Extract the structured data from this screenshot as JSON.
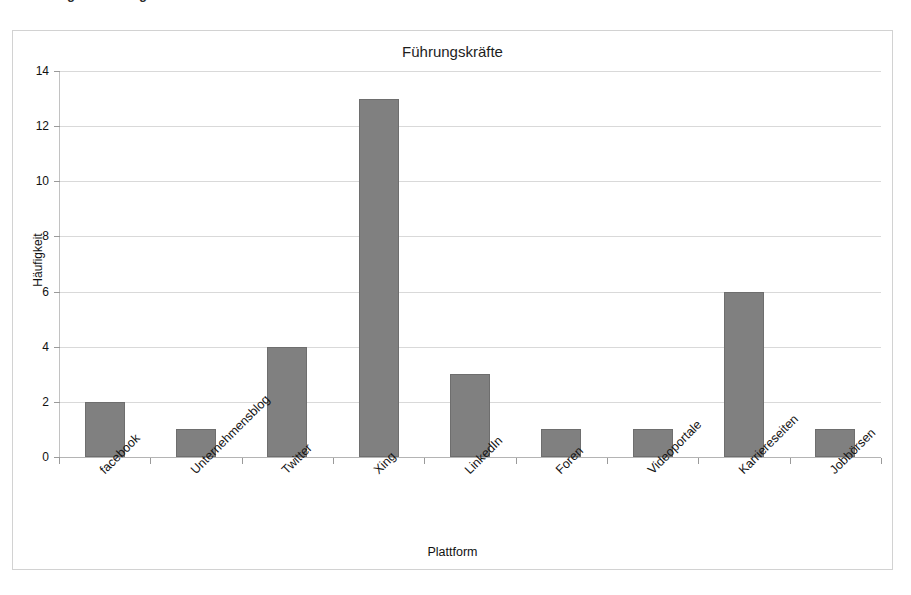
{
  "page": {
    "top_cut_text": "Abbildung 5: Nutzung der Plattformen der festen Mitarbeiter"
  },
  "chart_data": {
    "type": "bar",
    "title": "Führungskräfte",
    "xlabel": "Plattform",
    "ylabel": "Häufigkeit",
    "categories": [
      "facebook",
      "Unternehmensblog",
      "Twitter",
      "Xing",
      "LinkedIn",
      "Foren",
      "Videoportale",
      "Karriereseiten",
      "Jobbörsen"
    ],
    "values": [
      2,
      1,
      4,
      13,
      3,
      1,
      1,
      6,
      1
    ],
    "ylim": [
      0,
      14
    ],
    "yticks": [
      0,
      2,
      4,
      6,
      8,
      10,
      12,
      14
    ],
    "ytick_labels": [
      "0",
      "2",
      "4",
      "6",
      "8",
      "10",
      "12",
      "14"
    ],
    "grid": true,
    "legend": false,
    "bar_color": "#808080",
    "grid_color": "#d9d9d9",
    "frame_color": "#d2d2d2"
  }
}
